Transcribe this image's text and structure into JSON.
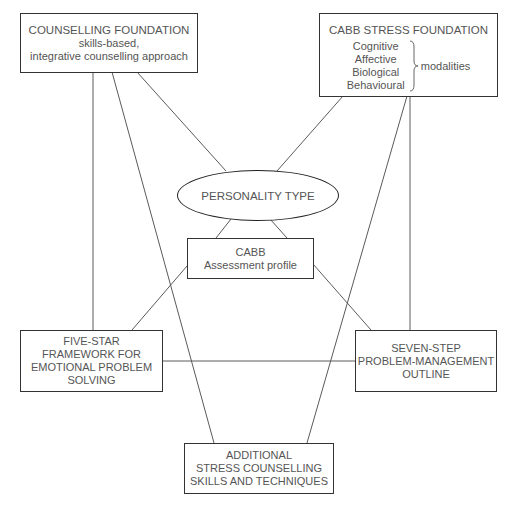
{
  "diagram": {
    "colors": {
      "background": "#ffffff",
      "border": "#333333",
      "line": "#555555",
      "text": "#555555"
    },
    "nodes": {
      "counselling_foundation": {
        "title": "COUNSELLING FOUNDATION",
        "line2": "skills-based,",
        "line3": "integrative counselling approach"
      },
      "cabb_stress_foundation": {
        "title": "CABB STRESS FOUNDATION",
        "modalities": [
          "Cognitive",
          "Affective",
          "Biological",
          "Behavioural"
        ],
        "modalities_label": "modalities"
      },
      "personality_type": {
        "label": "PERSONALITY TYPE"
      },
      "cabb_assessment": {
        "line1": "CABB",
        "line2": "Assessment profile"
      },
      "five_star": {
        "lines": [
          "FIVE-STAR",
          "FRAMEWORK FOR",
          "EMOTIONAL PROBLEM",
          "SOLVING"
        ]
      },
      "seven_step": {
        "lines": [
          "SEVEN-STEP",
          "PROBLEM-MANAGEMENT",
          "OUTLINE"
        ]
      },
      "additional_skills": {
        "lines": [
          "ADDITIONAL",
          "STRESS COUNSELLING",
          "SKILLS AND TECHNIQUES"
        ]
      }
    },
    "edges": [
      {
        "from": "counselling_foundation",
        "to": "five_star"
      },
      {
        "from": "counselling_foundation",
        "to": "additional_skills"
      },
      {
        "from": "counselling_foundation",
        "to": "personality_type"
      },
      {
        "from": "cabb_stress_foundation",
        "to": "personality_type"
      },
      {
        "from": "cabb_stress_foundation",
        "to": "additional_skills"
      },
      {
        "from": "cabb_stress_foundation",
        "to": "seven_step"
      },
      {
        "from": "personality_type",
        "to": "cabb_assessment"
      },
      {
        "from": "personality_type",
        "to": "cabb_assessment"
      },
      {
        "from": "cabb_assessment",
        "to": "five_star"
      },
      {
        "from": "cabb_assessment",
        "to": "seven_step"
      },
      {
        "from": "five_star",
        "to": "seven_step"
      }
    ]
  }
}
